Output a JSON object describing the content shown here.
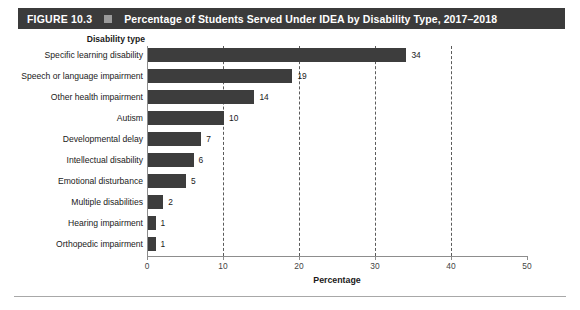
{
  "figure": {
    "number_label": "FIGURE 10.3",
    "separator_icon": "square-bullet-icon",
    "title": "Percentage of Students Served Under IDEA by Disability Type, 2017–2018"
  },
  "colors": {
    "title_bar_bg": "#3b3b3b",
    "title_text": "#ffffff",
    "title_square": "#9b9b9b",
    "bar_fill": "#3d3d3d",
    "axis_line": "#8d8d8d",
    "gridline": "#5a5a5a",
    "page_bg": "#ffffff",
    "label_text": "#1a1a1a"
  },
  "chart_data": {
    "type": "bar",
    "orientation": "horizontal",
    "title": "Percentage of Students Served Under IDEA by Disability Type, 2017–2018",
    "categories": [
      "Specific learning disability",
      "Speech or language impairment",
      "Other health impairment",
      "Autism",
      "Developmental delay",
      "Intellectual disability",
      "Emotional disturbance",
      "Multiple disabilities",
      "Hearing impairment",
      "Orthopedic impairment"
    ],
    "values": [
      34,
      19,
      14,
      10,
      7,
      6,
      5,
      2,
      1,
      1
    ],
    "data_labels": [
      "34",
      "19",
      "14",
      "10",
      "7",
      "6",
      "5",
      "2",
      "1",
      "1"
    ],
    "xlabel": "Percentage",
    "ylabel": "Disability type",
    "xlim": [
      0,
      50
    ],
    "xticks": [
      0,
      10,
      20,
      30,
      40,
      50
    ],
    "xtick_labels": [
      "0",
      "10",
      "20",
      "30",
      "40",
      "50"
    ],
    "gridlines_x": [
      10,
      20,
      30,
      40
    ],
    "grid": true,
    "grid_style": "dashed-vertical",
    "legend": null,
    "legend_position": "none"
  }
}
